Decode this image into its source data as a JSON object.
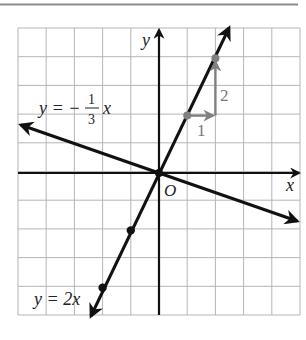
{
  "figure": {
    "top_rule_color": "#8a8a8a",
    "grid": {
      "x_min": -5,
      "x_max": 5,
      "y_min": -5,
      "y_max": 5,
      "step": 1,
      "color": "#b5b5b5"
    },
    "axes": {
      "x_label": "x",
      "y_label": "y",
      "origin_label": "O",
      "color": "#111111"
    },
    "lines": [
      {
        "id": "line-steep",
        "equation_lhs": "y = 2x",
        "slope": 2,
        "points": [
          [
            -1,
            -2
          ],
          [
            -2,
            -4
          ]
        ],
        "color": "#111111"
      },
      {
        "id": "line-shallow",
        "equation_prefix": "y = −",
        "fraction_num": "1",
        "fraction_den": "3",
        "equation_suffix": "x",
        "slope": -0.3333,
        "color": "#111111"
      }
    ],
    "slope_triangle": {
      "color": "#808080",
      "start": [
        1,
        2
      ],
      "corner": [
        2,
        2
      ],
      "end": [
        2,
        4
      ],
      "run_label": "1",
      "rise_label": "2"
    }
  },
  "chart_data": {
    "type": "line",
    "title": "",
    "xlabel": "x",
    "ylabel": "y",
    "xlim": [
      -5,
      5
    ],
    "ylim": [
      -5,
      5
    ],
    "grid": true,
    "series": [
      {
        "name": "y = 2x",
        "slope": 2,
        "intercept": 0,
        "marked_points": [
          [
            0,
            0
          ],
          [
            1,
            2
          ],
          [
            2,
            4
          ],
          [
            -1,
            -2
          ],
          [
            -2,
            -4
          ]
        ]
      },
      {
        "name": "y = -1/3 x",
        "slope": -0.3333,
        "intercept": 0,
        "marked_points": [
          [
            0,
            0
          ]
        ]
      }
    ],
    "annotations": [
      {
        "text": "1",
        "type": "run",
        "from": [
          1,
          2
        ],
        "to": [
          2,
          2
        ]
      },
      {
        "text": "2",
        "type": "rise",
        "from": [
          2,
          2
        ],
        "to": [
          2,
          4
        ]
      },
      {
        "text": "O",
        "at": [
          0,
          0
        ]
      }
    ]
  }
}
